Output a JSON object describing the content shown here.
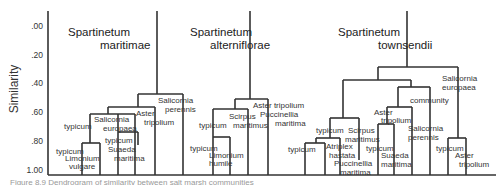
{
  "axis": {
    "ylabel": "Similarity",
    "ticks": [
      ".00",
      ".20",
      ".40",
      ".60",
      ".80",
      "1.00"
    ]
  },
  "dendrograms": [
    {
      "title_line1": "Spartinetum",
      "title_line2": "maritimae",
      "labels": {
        "salicornia_perennis_1": "Salicornia",
        "salicornia_perennis_2": "perennis",
        "aster_1": "Aster",
        "aster_2": "tripolium",
        "salicornia_europaea_1": "Salicornia",
        "salicornia_europaea_2": "europaea",
        "typicum_a": "typicum",
        "typicum_b": "typicum",
        "suaeda_1": "Suaeda",
        "suaeda_2": "maritima",
        "typicum_c": "typicum",
        "limonium_1": "Limonium",
        "limonium_2": "vulgare"
      }
    },
    {
      "title_line1": "Spartinetum",
      "title_line2": "alterniflorae",
      "labels": {
        "aster": "Aster tripolium",
        "puccinellia_1": "Puccinellia",
        "puccinellia_2": "maritima",
        "scirpus_1": "Scirpus",
        "scirpus_2": "maritimus",
        "typicum_a": "typicum",
        "typicum_b": "typicum",
        "limonium_1": "Limonium",
        "limonium_2": "humile"
      }
    },
    {
      "title_line1": "Spartinetum",
      "title_line2": "townsendii",
      "labels": {
        "salicornia_europaea_1": "Salicornia",
        "salicornia_europaea_2": "europaea",
        "community": "community",
        "aster_a_1": "Aster",
        "aster_a_2": "tripolium",
        "salicornia_perennis_1": "Salicornia",
        "salicornia_perennis_2": "perennis",
        "typicum_a": "typicum",
        "scirpus_1": "Scirpus",
        "scirpus_2": "maritimus",
        "typicum_b": "typicum",
        "atriplex_1": "Atriplex",
        "atriplex_2": "hastata",
        "puccinellia_1": "Puccinellia",
        "puccinellia_2": "maritima",
        "typicum_c": "typicum",
        "suaeda_1": "Suaeda",
        "suaeda_2": "maritima",
        "typicum_d": "typicum",
        "aster_b_1": "Aster",
        "aster_b_2": "tripolium"
      }
    }
  ],
  "caption": "Figure 8.9  Dendrogram of similarity between salt marsh communities"
}
